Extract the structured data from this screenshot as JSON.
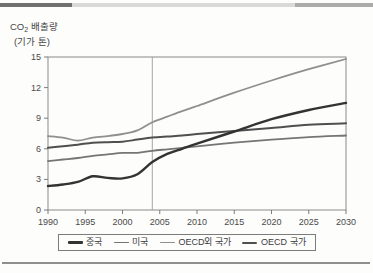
{
  "page": {
    "top_bar_colors": [
      "#707070",
      "#d9d9d9",
      "#ababab"
    ],
    "bottom_rule_color": "#8f8f8f",
    "frame_color": "#8a8a8a",
    "tick_color": "#7d7d7d",
    "label_color": "#4a4a4a",
    "reference_line_color": "#9b9b9b"
  },
  "chart_data": {
    "type": "line",
    "title": "",
    "y_title": {
      "prefix": "CO",
      "subscript": "2",
      "suffix": "배출량",
      "line2": "(기가 톤)"
    },
    "xlabel": "",
    "ylabel": "CO2 배출량 (기가 톤)",
    "grid": false,
    "legend_position": "bottom",
    "ylim": [
      0,
      15
    ],
    "yticks": [
      0,
      3,
      6,
      9,
      12,
      15
    ],
    "xticks": [
      1990,
      1995,
      2000,
      2005,
      2010,
      2015,
      2020,
      2025,
      2030
    ],
    "xlim": [
      1990,
      2030
    ],
    "reference_line_x": 2004,
    "x": [
      1990,
      1992,
      1994,
      1996,
      1998,
      2000,
      2002,
      2004,
      2006,
      2008,
      2010,
      2015,
      2020,
      2025,
      2030
    ],
    "series": [
      {
        "key": "china",
        "name": "중국",
        "color": "#333333",
        "width": 2.4,
        "values": [
          2.35,
          2.5,
          2.75,
          3.3,
          3.15,
          3.1,
          3.5,
          4.7,
          5.5,
          6.0,
          6.5,
          7.7,
          8.9,
          9.8,
          10.5
        ]
      },
      {
        "key": "usa",
        "name": "미국",
        "color": "#757575",
        "width": 1.8,
        "values": [
          4.8,
          4.95,
          5.1,
          5.3,
          5.45,
          5.6,
          5.6,
          5.8,
          5.95,
          6.1,
          6.25,
          6.6,
          6.9,
          7.15,
          7.3
        ]
      },
      {
        "key": "non-oecd",
        "name": "OECD외 국가",
        "color": "#8f8f8f",
        "width": 1.8,
        "values": [
          7.25,
          7.1,
          6.8,
          7.1,
          7.25,
          7.45,
          7.8,
          8.6,
          9.15,
          9.7,
          10.2,
          11.5,
          12.7,
          13.8,
          14.8
        ]
      },
      {
        "key": "oecd",
        "name": "OECD 국가",
        "color": "#4f4f4f",
        "width": 2.0,
        "values": [
          6.1,
          6.25,
          6.4,
          6.6,
          6.65,
          6.7,
          6.9,
          7.1,
          7.2,
          7.3,
          7.45,
          7.75,
          8.05,
          8.35,
          8.5
        ]
      }
    ]
  }
}
